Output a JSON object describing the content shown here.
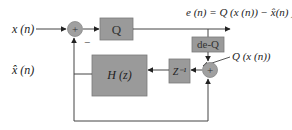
{
  "diagram": {
    "title": "",
    "colors": {
      "block_fill": "#9a9a9a",
      "block_stroke": "#7a7a7a",
      "sum_fill": "#a0a0a0",
      "line": "#444444",
      "background": "#ffffff"
    },
    "labels": {
      "input": "x (n)",
      "estimate": "x̂ (n)",
      "error": "e (n) = Q (x (n)) − x̂(n) )",
      "quantized": "Q (x (n))"
    },
    "blocks": {
      "quantizer": "Q",
      "dequantizer": "de-Q",
      "delay": "Z⁻¹",
      "filter": "H (z)"
    },
    "sum_nodes": {
      "sum1": {
        "symbol": "+",
        "minus_input": "−"
      },
      "sum2": {
        "symbol": "+"
      }
    }
  }
}
